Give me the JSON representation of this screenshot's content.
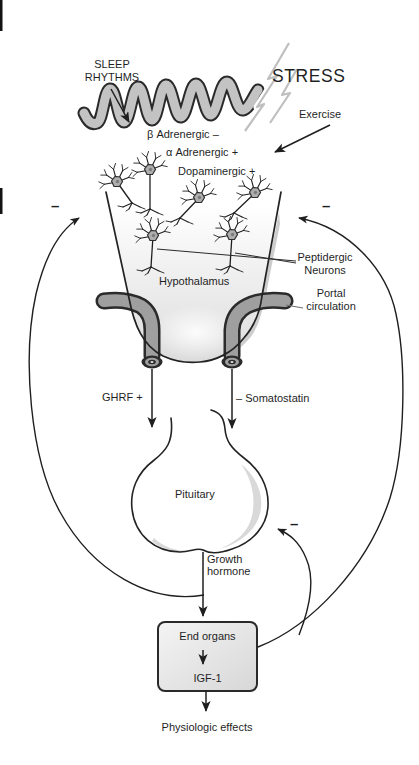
{
  "figure": {
    "colors": {
      "ink": "#1f1f1f",
      "cortex_ribbon_fill": "#c3c3c3",
      "lightning_gray": "#c0c0c0",
      "vessel_fill": "#9f9f9f",
      "funnel_shade": "#dedede",
      "crescent_shade": "#cdcdcd",
      "box_fill": "#e8e8e8"
    },
    "labels": {
      "sleep_rhythms": "SLEEP\nRHYTHMS",
      "stress": "STRESS",
      "exercise": "Exercise",
      "beta_adrenergic": "β Adrenergic –",
      "alpha_adrenergic": "α Adrenergic +",
      "dopaminergic": "Dopaminergic +",
      "minus_feedback_left": "–",
      "minus_feedback_right": "–",
      "peptidergic_neurons": "Peptidergic\nNeurons",
      "hypothalamus": "Hypothalamus",
      "portal_circulation": "Portal\ncirculation",
      "ghrf": "GHRF +",
      "somatostatin": "– Somatostatin",
      "pituitary": "Pituitary",
      "minus_feedback_pituitary": "–",
      "growth_hormone": "Growth\nhormone",
      "end_organs": "End organs",
      "igf1": "IGF-1",
      "physiologic_effects": "Physiologic effects"
    }
  }
}
